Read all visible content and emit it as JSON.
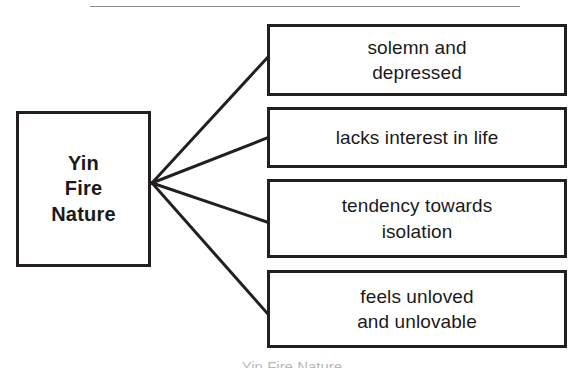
{
  "diagram": {
    "title": "Yin Fire Nature",
    "type": "radial-branch-diagram",
    "canvas": {
      "width": 584,
      "height": 368
    },
    "colors": {
      "background": "#ffffff",
      "box_border": "#231f20",
      "text": "#1a1a1a",
      "connector": "#231f20",
      "top_rule": "#8a8a8a",
      "faint_caption": "#b9b9b9"
    },
    "top_rule": {
      "x1": 90,
      "y1": 6,
      "x2": 520,
      "y2": 6
    },
    "root": {
      "label": "Yin\nFire\nNature",
      "lines": [
        "Yin",
        "Fire",
        "Nature"
      ],
      "bold": true,
      "x": 16,
      "y": 111,
      "width": 135,
      "height": 156
    },
    "hub": {
      "x": 152,
      "y": 183
    },
    "branches": [
      {
        "id": "branch-solemn-and-depressed",
        "lines": [
          "solemn and",
          "depressed"
        ],
        "text": "solemn and depressed",
        "x": 267,
        "y": 24,
        "width": 300,
        "height": 72,
        "connector_end": {
          "x": 267,
          "y": 58
        }
      },
      {
        "id": "branch-lacks-interest-in-life",
        "lines": [
          "lacks interest in life"
        ],
        "text": "lacks interest in life",
        "x": 267,
        "y": 107,
        "width": 300,
        "height": 61,
        "connector_end": {
          "x": 267,
          "y": 138
        }
      },
      {
        "id": "branch-tendency-towards-isolation",
        "lines": [
          "tendency towards",
          "isolation"
        ],
        "text": "tendency towards isolation",
        "x": 267,
        "y": 179,
        "width": 300,
        "height": 79,
        "connector_end": {
          "x": 267,
          "y": 222
        }
      },
      {
        "id": "branch-feels-unloved-and-unlovable",
        "lines": [
          "feels unloved",
          "and unlovable"
        ],
        "text": "feels unloved and unlovable",
        "x": 267,
        "y": 270,
        "width": 300,
        "height": 78,
        "connector_end": {
          "x": 267,
          "y": 313
        }
      }
    ],
    "bottom_caption": "Yin Fire Nature"
  }
}
